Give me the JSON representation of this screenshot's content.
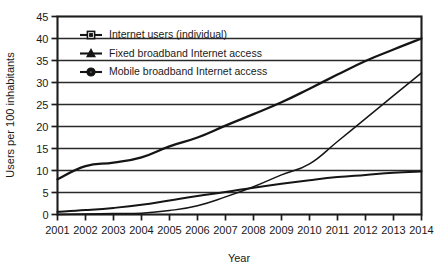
{
  "chart_data": {
    "type": "line",
    "title": "",
    "xlabel": "Year",
    "ylabel": "Users per 100 inhabitants",
    "categories": [
      "2001",
      "2002",
      "2003",
      "2004",
      "2005",
      "2006",
      "2007",
      "2008",
      "2009",
      "2010",
      "2011",
      "2012",
      "2013",
      "2014"
    ],
    "x": [
      2001,
      2002,
      2003,
      2004,
      2005,
      2006,
      2007,
      2008,
      2009,
      2010,
      2011,
      2012,
      2013,
      2014
    ],
    "xlim": [
      2001,
      2014
    ],
    "ylim": [
      0,
      45
    ],
    "y_ticks": [
      0,
      5,
      10,
      15,
      20,
      25,
      30,
      35,
      40,
      45
    ],
    "x_ticks": [
      2001,
      2002,
      2003,
      2004,
      2005,
      2006,
      2007,
      2008,
      2009,
      2010,
      2011,
      2012,
      2013,
      2014
    ],
    "grid": true,
    "grid_axis": "y",
    "legend_position": "top-left-inside",
    "series": [
      {
        "name": "Internet users (individual)",
        "marker": "square-open",
        "values": [
          8.0,
          11.0,
          11.8,
          13.0,
          15.5,
          17.5,
          20.2,
          22.8,
          25.5,
          28.6,
          31.8,
          34.9,
          37.5,
          40.0
        ]
      },
      {
        "name": "Fixed broadband Internet access",
        "marker": "triangle-filled",
        "values": [
          0.6,
          1.0,
          1.5,
          2.2,
          3.2,
          4.2,
          5.1,
          6.1,
          7.0,
          7.8,
          8.5,
          9.0,
          9.5,
          9.8
        ]
      },
      {
        "name": "Mobile broadband Internet access",
        "marker": "circle-filled",
        "values": [
          0.0,
          0.1,
          0.2,
          0.3,
          0.9,
          2.0,
          4.0,
          6.3,
          9.0,
          11.5,
          16.6,
          21.8,
          27.0,
          32.2
        ]
      }
    ]
  },
  "legend": {
    "items": [
      {
        "label": "Internet users (individual)",
        "marker": "square-open"
      },
      {
        "label": "Fixed broadband Internet access",
        "marker": "triangle-filled"
      },
      {
        "label": "Mobile broadband Internet access",
        "marker": "circle-filled"
      }
    ]
  },
  "axes": {
    "y_title": "Users per 100 inhabitants",
    "x_title": "Year",
    "y_tick_labels": [
      "0",
      "5",
      "10",
      "15",
      "20",
      "25",
      "30",
      "35",
      "40",
      "45"
    ],
    "x_tick_labels": [
      "2001",
      "2002",
      "2003",
      "2004",
      "2005",
      "2006",
      "2007",
      "2008",
      "2009",
      "2010",
      "2011",
      "2012",
      "2013",
      "2014"
    ]
  },
  "colors": {
    "line": "#151515",
    "grid": "#2a2a2a",
    "axis": "#1c1c1c",
    "background": "#ffffff",
    "text": "#1a1a1a"
  }
}
